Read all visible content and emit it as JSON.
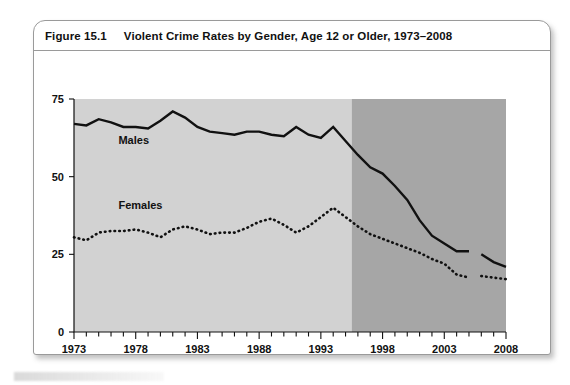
{
  "figure": {
    "number": "Figure 15.1",
    "title": "Violent Crime Rates by Gender, Age 12 or Older, 1973–2008"
  },
  "chart_data": {
    "type": "line",
    "title": "Violent Crime Rates by Gender, Age 12 or Older, 1973–2008",
    "xlabel": "",
    "ylabel": "",
    "xlim": [
      1973,
      2008
    ],
    "ylim": [
      0,
      75
    ],
    "yticks": [
      0,
      25,
      50,
      75
    ],
    "ytick_labels": [
      "0",
      "25",
      "50",
      "75"
    ],
    "xticks": [
      1973,
      1978,
      1983,
      1988,
      1993,
      1998,
      2003,
      2008
    ],
    "xtick_labels": [
      "1973",
      "1978",
      "1983",
      "1988",
      "1993",
      "1998",
      "2003",
      "2008"
    ],
    "xtick_minor_step": 1,
    "grid": false,
    "legend": "inline-labels",
    "plot_background_bands": [
      {
        "name": "old-methodology",
        "from": 1973,
        "to": 1995.5,
        "color": "#d2d2d2"
      },
      {
        "name": "redesigned-methodology",
        "from": 1995.5,
        "to": 2008,
        "color": "#a6a6a6"
      }
    ],
    "series": [
      {
        "name": "Males",
        "label": "Males",
        "style": "solid",
        "color": "#111111",
        "label_position": {
          "x": 1976.6,
          "y": 60.5
        },
        "x": [
          1973,
          1974,
          1975,
          1976,
          1977,
          1978,
          1979,
          1980,
          1981,
          1982,
          1983,
          1984,
          1985,
          1986,
          1987,
          1988,
          1989,
          1990,
          1991,
          1992,
          1993,
          1994,
          1995,
          1996,
          1997,
          1998,
          1999,
          2000,
          2001,
          2002,
          2003,
          2004,
          2005
        ],
        "y": [
          67,
          66.5,
          68.5,
          67.5,
          66,
          66,
          65.5,
          68,
          71,
          69,
          66,
          64.5,
          64,
          63.5,
          64.5,
          64.5,
          63.5,
          63,
          66,
          63.5,
          62.5,
          66,
          61.5,
          57,
          53,
          51,
          47,
          42.5,
          36,
          31,
          28.5,
          26,
          26
        ],
        "segment_break_after": 2005,
        "tail_x": [
          2006,
          2007,
          2008
        ],
        "tail_y": [
          25,
          22.5,
          21
        ]
      },
      {
        "name": "Females",
        "label": "Females",
        "style": "dotted",
        "color": "#111111",
        "label_position": {
          "x": 1976.6,
          "y": 39.5
        },
        "x": [
          1973,
          1974,
          1975,
          1976,
          1977,
          1978,
          1979,
          1980,
          1981,
          1982,
          1983,
          1984,
          1985,
          1986,
          1987,
          1988,
          1989,
          1990,
          1991,
          1992,
          1993,
          1994,
          1995,
          1996,
          1997,
          1998,
          1999,
          2000,
          2001,
          2002,
          2003,
          2004,
          2005
        ],
        "y": [
          30.5,
          29.5,
          32,
          32.5,
          32.5,
          33,
          32,
          30.5,
          33,
          34,
          33,
          31.5,
          32,
          32,
          33.5,
          35.5,
          36.5,
          34.5,
          32,
          34,
          37,
          40,
          37,
          34,
          31.5,
          30,
          28.5,
          27,
          25.5,
          23.5,
          22,
          18.5,
          17.5
        ],
        "segment_break_after": 2005,
        "tail_x": [
          2006,
          2007,
          2008
        ],
        "tail_y": [
          18,
          17.5,
          17
        ]
      }
    ]
  }
}
